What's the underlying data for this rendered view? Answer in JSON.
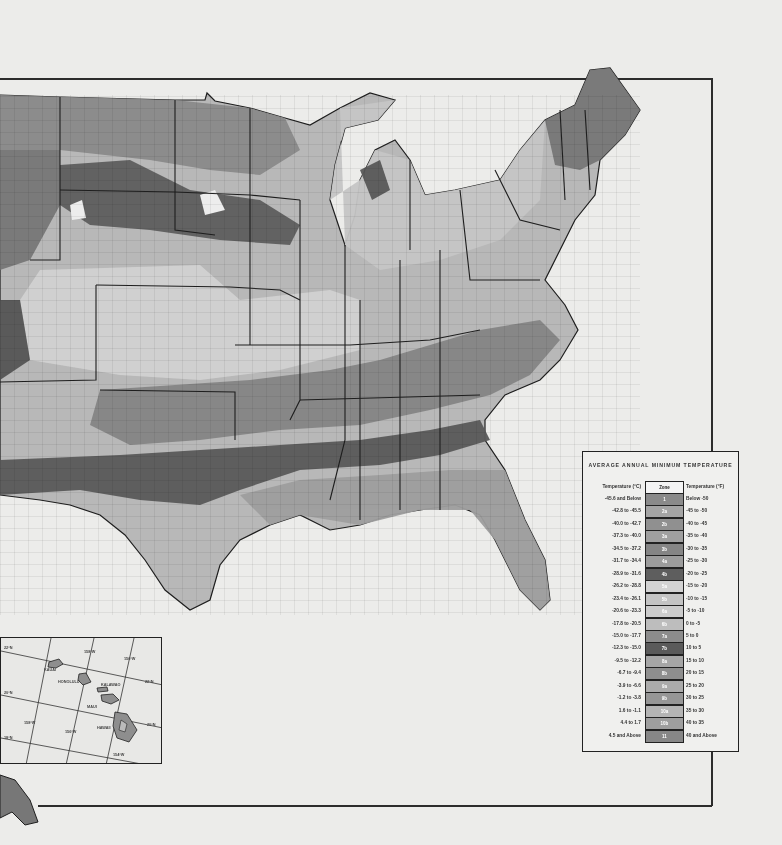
{
  "map": {
    "subject": "USDA Plant Hardiness Zone Map (contiguous United States, grayscale)",
    "colors": {
      "paper": "#ececea",
      "border": "#2c2c2c",
      "state_line": "#1e1e1e"
    }
  },
  "legend": {
    "title": "AVERAGE ANNUAL MINIMUM TEMPERATURE",
    "col_c_header": "Temperature (°C)",
    "col_zone_header": "Zone",
    "col_f_header": "Temperature (°F)",
    "rows": [
      {
        "c": "-45.6  and Below",
        "zone": "1",
        "f": "Below  -50",
        "shade": "#8a8a8a"
      },
      {
        "c": "-42.8  to  -45.5",
        "zone": "2a",
        "f": "-45  to  -50",
        "shade": "#a4a4a4"
      },
      {
        "c": "-40.0  to  -42.7",
        "zone": "2b",
        "f": "-40  to  -45",
        "shade": "#909090"
      },
      {
        "c": "-37.3  to  -40.0",
        "zone": "3a",
        "f": "-35  to  -40",
        "shade": "#a0a0a0"
      },
      {
        "c": "-34.5  to  -37.2",
        "zone": "3b",
        "f": "-30  to  -35",
        "shade": "#858585"
      },
      {
        "c": "-31.7  to  -34.4",
        "zone": "4a",
        "f": "-25  to  -30",
        "shade": "#9c9c9c"
      },
      {
        "c": "-28.9  to  -31.6",
        "zone": "4b",
        "f": "-20  to  -25",
        "shade": "#5e5e5e"
      },
      {
        "c": "-26.2  to  -28.8",
        "zone": "5a",
        "f": "-15  to  -20",
        "shade": "#d2d2d2"
      },
      {
        "c": "-23.4  to  -26.1",
        "zone": "5b",
        "f": "-10  to  -15",
        "shade": "#c4c4c4"
      },
      {
        "c": "-20.6  to  -23.3",
        "zone": "6a",
        "f": "-5  to  -10",
        "shade": "#cccccc"
      },
      {
        "c": "-17.8  to  -20.5",
        "zone": "6b",
        "f": "0  to  -5",
        "shade": "#bdbdbd"
      },
      {
        "c": "-15.0  to  -17.7",
        "zone": "7a",
        "f": "5  to  0",
        "shade": "#8c8c8c"
      },
      {
        "c": "-12.3  to  -15.0",
        "zone": "7b",
        "f": "10  to  5",
        "shade": "#5a5a5a"
      },
      {
        "c": "-9.5  to  -12.2",
        "zone": "8a",
        "f": "15  to  10",
        "shade": "#a6a6a6"
      },
      {
        "c": "-6.7  to  -9.4",
        "zone": "8b",
        "f": "20  to  15",
        "shade": "#8e8e8e"
      },
      {
        "c": "-3.9  to  -6.6",
        "zone": "9a",
        "f": "25  to  20",
        "shade": "#ababab"
      },
      {
        "c": "-1.2  to  -3.8",
        "zone": "9b",
        "f": "30  to  25",
        "shade": "#969696"
      },
      {
        "c": "1.6  to  -1.1",
        "zone": "10a",
        "f": "35  to  30",
        "shade": "#b4b4b4"
      },
      {
        "c": "4.4  to  1.7",
        "zone": "10b",
        "f": "40  to  35",
        "shade": "#9e9e9e"
      },
      {
        "c": "4.5  and Above",
        "zone": "11",
        "f": "40  and Above",
        "shade": "#878787"
      }
    ]
  },
  "hawaii_inset": {
    "islands": [
      "KAUAI",
      "HONOLULU",
      "KALAWAO",
      "MAUI",
      "HAWAII"
    ],
    "grid_labels": [
      "22°N",
      "158°W",
      "156°W",
      "22°N",
      "20°N",
      "20°N",
      "158°W",
      "156°W",
      "18°N",
      "154°W"
    ]
  }
}
